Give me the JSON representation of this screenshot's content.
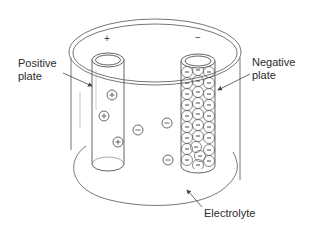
{
  "diagram": {
    "type": "battery-cell-schematic",
    "labels": {
      "positive_plate": [
        "Positive",
        "plate"
      ],
      "negative_plate": [
        "Negative",
        "plate"
      ],
      "electrolyte": "Electrolyte"
    },
    "terminals": {
      "positive_symbol": "+",
      "negative_symbol": "−"
    },
    "ions": {
      "positive_count_in_electrolyte": 3,
      "negative_count_in_electrolyte": 3,
      "positive_symbol": "+",
      "negative_symbol": "−"
    },
    "colors": {
      "line": "#555555",
      "text": "#2b2b2b",
      "background": "#ffffff"
    }
  }
}
